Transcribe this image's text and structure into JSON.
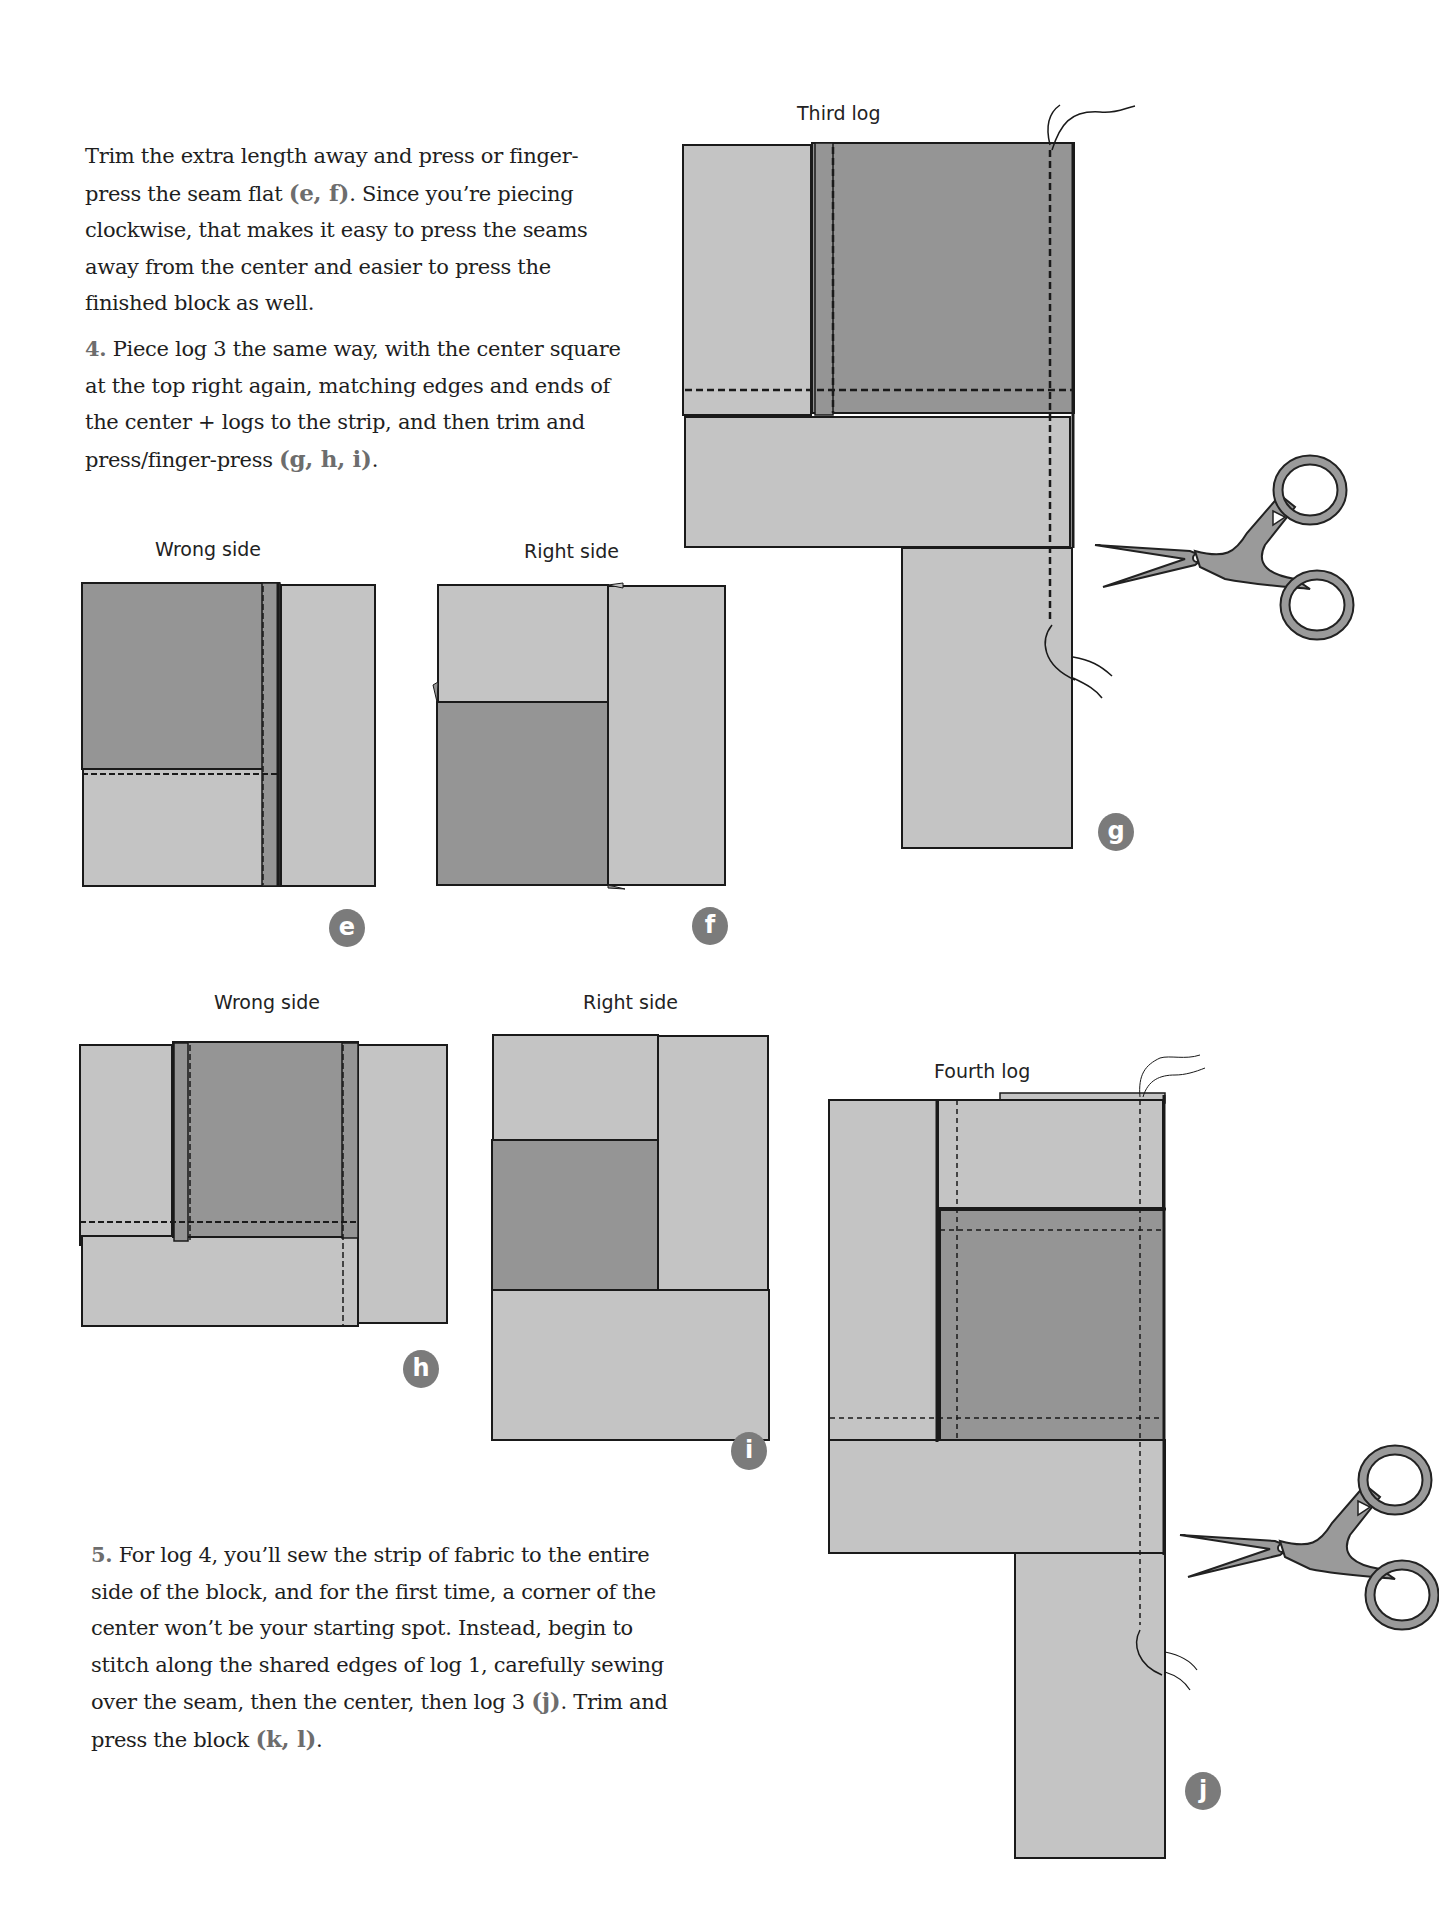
{
  "paragraphs": {
    "p1": {
      "text_before": "Trim the extra length away and press or finger-press the seam flat ",
      "ref": "(e, f)",
      "text_after": ". Since you’re piecing clockwise, that makes it easy to press the seams away from the center and easier to press the finished block as well."
    },
    "step4": {
      "number": "4.",
      "text_before": " Piece log 3 the same way, with the center square at the top right again, matching edges and ends of the center + logs to the strip, and then trim and press/finger-press ",
      "ref": "(g, h, i)",
      "text_after": "."
    },
    "step5": {
      "number": "5.",
      "text_before": " For log 4, you’ll sew the strip of fabric to the entire side of the block, and for the first time, a corner of the center won’t be your starting spot. Instead, begin to stitch along the shared edges of log 1, carefully sewing over the seam, then the center, then log 3 ",
      "ref": "(j)",
      "text_middle": ". Trim and press the block ",
      "ref2": "(k, l)",
      "text_after": "."
    }
  },
  "figures": {
    "e": {
      "label": "Wrong side",
      "badge": "e"
    },
    "f": {
      "label": "Right side",
      "badge": "f"
    },
    "g": {
      "label": "Third log",
      "badge": "g"
    },
    "h": {
      "label": "Wrong side",
      "badge": "h"
    },
    "i": {
      "label": "Right side",
      "badge": "i"
    },
    "j": {
      "label": "Fourth log",
      "badge": "j"
    }
  },
  "colors": {
    "light_fabric": "#c4c4c4",
    "dark_fabric": "#959595",
    "outline": "#1a1a1a",
    "badge": "#7b7b7b",
    "reference_text": "#6d6d6d"
  }
}
